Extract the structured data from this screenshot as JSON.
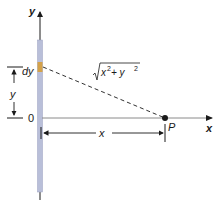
{
  "diagram": {
    "axis_labels": {
      "y": "y",
      "x": "x"
    },
    "origin_label": "0",
    "element_label": "dy",
    "distance_label_base": "x",
    "distance_label_exp1": "2",
    "distance_label_plus": " + y",
    "distance_label_exp2": "2",
    "point_label": "P",
    "y_dimension_label": "y",
    "x_dimension_label": "x",
    "colors": {
      "rod": "#b9bfd9",
      "rod_edge": "#9aa0bf",
      "element": "#d4a24a",
      "line": "#1a1a1a",
      "axis_gray": "#8a8a8a"
    }
  }
}
